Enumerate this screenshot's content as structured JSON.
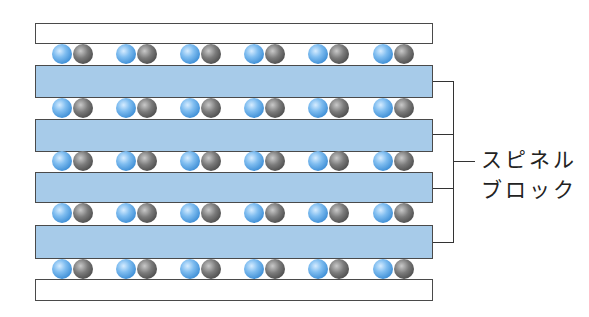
{
  "diagram": {
    "type": "spinel-block layered structure",
    "label_line1": "スピネル",
    "label_line2": "ブロック",
    "colors": {
      "spinel_block": "#a7cbe9",
      "boundary_layer": "#ffffff",
      "blue_ion": "#4a9be0",
      "gray_ion": "#5a5a5a",
      "outline": "#4a4a4a"
    },
    "layers": [
      {
        "kind": "boundary",
        "top": 23,
        "height": 21
      },
      {
        "kind": "spinel",
        "top": 65,
        "height": 33
      },
      {
        "kind": "spinel",
        "top": 119,
        "height": 33
      },
      {
        "kind": "spinel",
        "top": 172,
        "height": 31
      },
      {
        "kind": "spinel",
        "top": 225,
        "height": 34
      },
      {
        "kind": "boundary",
        "top": 279,
        "height": 22
      }
    ],
    "ion_rows_y": [
      44,
      98,
      151,
      203,
      259
    ],
    "ion_pair_x": [
      52,
      116,
      180,
      244,
      308,
      373
    ],
    "ion_pairs_per_row": 6
  }
}
